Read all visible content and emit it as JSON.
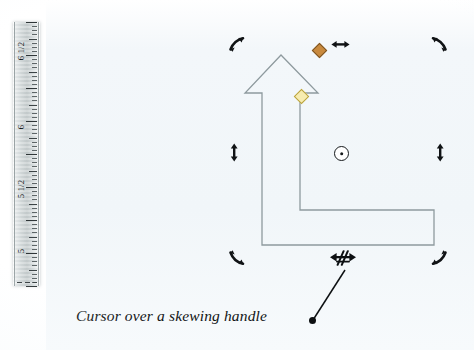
{
  "figure": {
    "caption": "Cursor over a skewing handle",
    "background_color": "#f2f7f9",
    "page_color": "#ffffff"
  },
  "ruler": {
    "name": "vertical-ruler",
    "orientation": "vertical",
    "unit": "inches",
    "labels": [
      "6 1/2",
      "6",
      "5 1/2",
      "5"
    ],
    "label_positions_px": [
      52,
      128,
      190,
      252
    ],
    "tick_color": "#3a4244",
    "body_color": "#c9d0d1"
  },
  "shape": {
    "name": "bent-up-arrow",
    "type": "elbow arrow autoshape",
    "outline_color": "#8e9a9e",
    "fill": "none",
    "points": "281,55 245,93 262,93 262,245 434,245 434,210 300,210 300,93 318,93",
    "selected": true
  },
  "handles": [
    {
      "name": "rotate-handle-top-left",
      "icon": "rotate-arrow-ne-icon",
      "x": 236,
      "y": 44,
      "interactable": true
    },
    {
      "name": "rotate-handle-top-right",
      "icon": "rotate-arrow-nw-icon",
      "x": 440,
      "y": 44,
      "interactable": true
    },
    {
      "name": "rotate-handle-bottom-left",
      "icon": "rotate-arrow-sw-icon",
      "x": 236,
      "y": 258,
      "interactable": true
    },
    {
      "name": "rotate-handle-bottom-right",
      "icon": "rotate-arrow-se-icon",
      "x": 440,
      "y": 258,
      "interactable": true
    },
    {
      "name": "skew-handle-top",
      "icon": "double-arrow-horizontal-icon",
      "x": 340,
      "y": 44,
      "interactable": true
    },
    {
      "name": "skew-handle-left",
      "icon": "double-arrow-vertical-icon",
      "x": 234,
      "y": 152,
      "interactable": true
    },
    {
      "name": "skew-handle-right",
      "icon": "double-arrow-vertical-icon",
      "x": 440,
      "y": 152,
      "interactable": true
    },
    {
      "name": "rotation-pivot-center",
      "icon": "rotation-center-icon",
      "x": 340,
      "y": 152,
      "interactable": true
    },
    {
      "name": "rotation-grip-amber",
      "icon": "diamond-handle-icon",
      "x": 318,
      "y": 49,
      "interactable": true,
      "color": "#c98a3e"
    },
    {
      "name": "adjustment-handle-gold",
      "icon": "diamond-handle-icon",
      "x": 300,
      "y": 95,
      "interactable": true,
      "color": "#f7ecb0"
    }
  ],
  "cursor": {
    "name": "skew-cursor",
    "icon": "skew-cursor-icon",
    "x": 342,
    "y": 262,
    "description": "horizontal double arrow with slanted parallel bars"
  },
  "leader": {
    "name": "caption-leader-line",
    "from_x": 313,
    "from_y": 320,
    "to_x": 345,
    "to_y": 270
  }
}
